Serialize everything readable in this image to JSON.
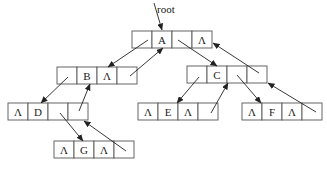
{
  "diagram": {
    "root_label": "root",
    "null_symbol": "Λ",
    "cell_width": 20,
    "cell_height": 17,
    "nodes": [
      {
        "id": "A",
        "x": 132,
        "y": 31,
        "cells": [
          "",
          "A",
          "",
          "Λ"
        ]
      },
      {
        "id": "B",
        "x": 57,
        "y": 67,
        "cells": [
          "",
          "B",
          "Λ",
          ""
        ]
      },
      {
        "id": "C",
        "x": 187,
        "y": 66,
        "cells": [
          "",
          "C",
          "",
          ""
        ]
      },
      {
        "id": "D",
        "x": 8,
        "y": 103,
        "cells": [
          "Λ",
          "D",
          "",
          ""
        ]
      },
      {
        "id": "E",
        "x": 138,
        "y": 103,
        "cells": [
          "Λ",
          "E",
          "Λ",
          ""
        ]
      },
      {
        "id": "F",
        "x": 242,
        "y": 103,
        "cells": [
          "Λ",
          "F",
          "Λ",
          ""
        ]
      },
      {
        "id": "G",
        "x": 54,
        "y": 141,
        "cells": [
          "Λ",
          "G",
          "Λ",
          ""
        ]
      }
    ],
    "edges": [
      {
        "from": "root",
        "to": "A",
        "type": "root-pointer",
        "x1": 154,
        "y1": 3,
        "x2": 162,
        "y2": 30
      },
      {
        "from": "A",
        "to": "B",
        "type": "left-child",
        "x1": 148,
        "y1": 40,
        "x2": 108,
        "y2": 67
      },
      {
        "from": "B",
        "to": "A",
        "type": "thread",
        "x1": 130,
        "y1": 76,
        "x2": 163,
        "y2": 48
      },
      {
        "from": "A",
        "to": "C",
        "type": "right-child",
        "x1": 178,
        "y1": 40,
        "x2": 217,
        "y2": 66
      },
      {
        "from": "C",
        "to": "A",
        "type": "thread",
        "x1": 259,
        "y1": 73,
        "x2": 213,
        "y2": 43
      },
      {
        "from": "B",
        "to": "D",
        "type": "left-child",
        "x1": 68,
        "y1": 77,
        "x2": 41,
        "y2": 103
      },
      {
        "from": "D",
        "to": "B",
        "type": "thread",
        "x1": 79,
        "y1": 111,
        "x2": 90,
        "y2": 84
      },
      {
        "from": "D",
        "to": "G",
        "type": "right-child",
        "x1": 60,
        "y1": 113,
        "x2": 83,
        "y2": 141
      },
      {
        "from": "G",
        "to": "D",
        "type": "thread",
        "x1": 126,
        "y1": 151,
        "x2": 84,
        "y2": 121
      },
      {
        "from": "C",
        "to": "E",
        "type": "left-child",
        "x1": 199,
        "y1": 77,
        "x2": 177,
        "y2": 103
      },
      {
        "from": "E",
        "to": "C",
        "type": "thread",
        "x1": 211,
        "y1": 113,
        "x2": 228,
        "y2": 83
      },
      {
        "from": "C",
        "to": "F",
        "type": "right-child",
        "x1": 237,
        "y1": 75,
        "x2": 261,
        "y2": 103
      },
      {
        "from": "F",
        "to": "C",
        "type": "thread",
        "x1": 316,
        "y1": 112,
        "x2": 268,
        "y2": 83
      }
    ]
  }
}
